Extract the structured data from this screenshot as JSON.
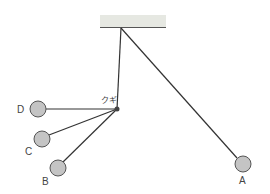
{
  "diagram": {
    "type": "pendulum-with-nail",
    "ceiling": {
      "x": 100,
      "y": 15,
      "width": 66,
      "height": 13,
      "color": "#e6e8e2"
    },
    "pivot": {
      "x": 121,
      "y": 28
    },
    "nail": {
      "x": 117,
      "y": 109,
      "label": "クギ",
      "color": "#444444"
    },
    "string_color": "#333333",
    "ball_fill": "#c4c4c4",
    "ball_stroke": "#555555",
    "positions": [
      {
        "id": "A",
        "label": "A",
        "cx": 243,
        "cy": 164,
        "r": 8
      },
      {
        "id": "B",
        "label": "B",
        "cx": 58,
        "cy": 168,
        "r": 8
      },
      {
        "id": "C",
        "label": "C",
        "cx": 42,
        "cy": 139,
        "r": 8
      },
      {
        "id": "D",
        "label": "D",
        "cx": 38,
        "cy": 109,
        "r": 8
      }
    ]
  }
}
